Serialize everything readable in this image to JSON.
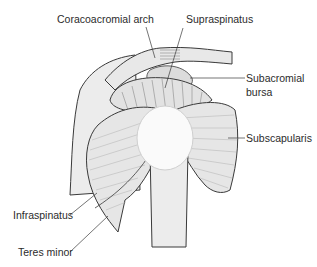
{
  "diagram": {
    "labels": {
      "coracoacromial_arch": "Coracoacromial arch",
      "supraspinatus": "Supraspinatus",
      "subacromial_bursa_line1": "Subacromial",
      "subacromial_bursa_line2": "bursa",
      "subscapularis": "Subscapularis",
      "infraspinatus": "Infraspinatus",
      "teres_minor": "Teres minor"
    },
    "colors": {
      "fill": "#e6e6e6",
      "fill_light": "#efefef",
      "outline": "#3a3a3a",
      "fiber": "#9a9a9a",
      "head": "#fafafa",
      "text": "#2b2b2b"
    }
  }
}
